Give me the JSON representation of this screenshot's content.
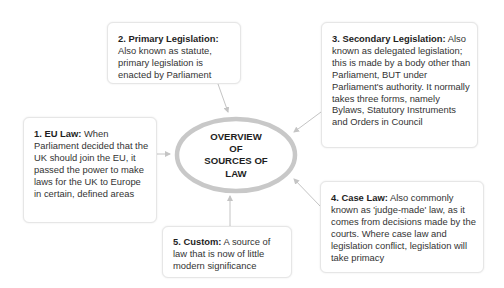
{
  "diagram": {
    "center": {
      "lines": [
        "OVERVIEW",
        "OF",
        "SOURCES OF",
        "LAW"
      ],
      "shape": "ellipse",
      "ring_color": "#c8c8c8"
    },
    "nodes": [
      {
        "id": "1",
        "title": "1. EU Law:",
        "text": " When Parliament decided that the UK should join the EU, it passed the power to make laws for the UK to Europe in certain, defined areas"
      },
      {
        "id": "2",
        "title": "2. Primary Legislation:",
        "text": " Also known as statute, primary legislation is enacted by Parliament"
      },
      {
        "id": "3",
        "title": "3. Secondary Legislation:",
        "text": " Also known as delegated legislation; this is made by a body other than Parliament, BUT under Parliament's authority. It normally takes three forms, namely Bylaws, Statutory Instruments and Orders in Council"
      },
      {
        "id": "4",
        "title": "4. Case Law:",
        "text": " Also commonly known as 'judge-made' law, as it comes from decisions made by the courts. Where case law and legislation conflict, legislation will take primacy"
      },
      {
        "id": "5",
        "title": "5. Custom:",
        "text": " A source of law that is now of little modern significance"
      }
    ],
    "edges": [
      {
        "from": "1",
        "to": "center"
      },
      {
        "from": "2",
        "to": "center"
      },
      {
        "from": "3",
        "to": "center"
      },
      {
        "from": "4",
        "to": "center"
      },
      {
        "from": "5",
        "to": "center"
      }
    ],
    "colors": {
      "connector": "#c4c4c4",
      "box_border": "#e6e6e6",
      "text": "#2b2b2b"
    }
  }
}
